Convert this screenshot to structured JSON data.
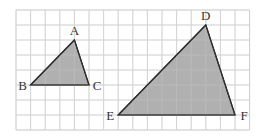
{
  "grid": {
    "origin_x": 16,
    "origin_y": 10,
    "cell_w": 14.6,
    "cell_h": 15,
    "cols": 16,
    "rows": 8,
    "line_color": "#d4d4d4",
    "border_color": "#cfcfcf"
  },
  "colors": {
    "fill": "#a9a9a9",
    "stroke": "#2e2e2e",
    "label": "#333333"
  },
  "triangles": [
    {
      "name": "ABC",
      "vertices": [
        {
          "label": "A",
          "gx": 4,
          "gy": 2,
          "label_dx": 0,
          "label_dy": -5,
          "anchor": "middle"
        },
        {
          "label": "B",
          "gx": 1,
          "gy": 5,
          "label_dx": -8,
          "label_dy": 5,
          "anchor": "middle"
        },
        {
          "label": "C",
          "gx": 5,
          "gy": 5,
          "label_dx": 8,
          "label_dy": 5,
          "anchor": "middle"
        }
      ]
    },
    {
      "name": "DEF",
      "vertices": [
        {
          "label": "D",
          "gx": 13,
          "gy": 1,
          "label_dx": 0,
          "label_dy": -5,
          "anchor": "middle"
        },
        {
          "label": "E",
          "gx": 7,
          "gy": 7,
          "label_dx": -8,
          "label_dy": 5,
          "anchor": "middle"
        },
        {
          "label": "F",
          "gx": 15,
          "gy": 7,
          "label_dx": 9,
          "label_dy": 5,
          "anchor": "middle"
        }
      ]
    }
  ],
  "labels": {
    "A": "A",
    "B": "B",
    "C": "C",
    "D": "D",
    "E": "E",
    "F": "F"
  }
}
